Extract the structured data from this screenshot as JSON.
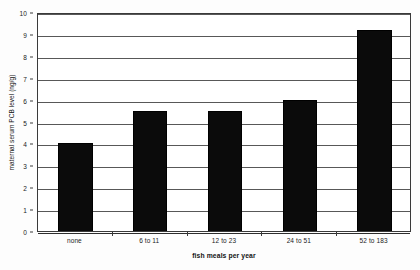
{
  "chart_data": {
    "type": "bar",
    "title": "",
    "subtitle": "",
    "xlabel": "fish meals per year",
    "ylabel": "maternal serum PCB level (ng/g)",
    "categories": [
      "none",
      "6 to 11",
      "12 to 23",
      "24 to 51",
      "52 to 183"
    ],
    "values": [
      4.0,
      5.5,
      5.5,
      6.0,
      9.2
    ],
    "series": [
      {
        "name": "maternal serum PCB level",
        "values": [
          4.0,
          5.5,
          5.5,
          6.0,
          9.2
        ]
      }
    ],
    "ylim": [
      0,
      10
    ],
    "ytick_labels": [
      "0",
      "1",
      "2",
      "3",
      "4",
      "5",
      "6",
      "7",
      "8",
      "9",
      "10"
    ],
    "ytick_values": [
      0,
      1,
      2,
      3,
      4,
      5,
      6,
      7,
      8,
      9,
      10
    ],
    "grid": true,
    "grid_axis": "y",
    "legend": false,
    "legend_position": "none",
    "bar_color": "#0b0b0b",
    "background_color": "#ffffff",
    "axis_color": "#3a3a3a",
    "annotations": []
  }
}
